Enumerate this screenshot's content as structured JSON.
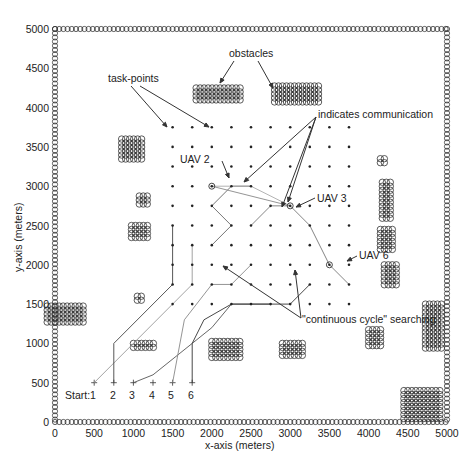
{
  "chart_data": {
    "type": "scatter",
    "title": "",
    "xlabel": "x-axis (meters)",
    "ylabel": "y-axis (meters)",
    "xlim": [
      0,
      5000
    ],
    "ylim": [
      0,
      5000
    ],
    "xticks": [
      0,
      500,
      1000,
      1500,
      2000,
      2500,
      3000,
      3500,
      4000,
      4500,
      5000
    ],
    "yticks": [
      0,
      500,
      1000,
      1500,
      2000,
      2500,
      3000,
      3500,
      4000,
      4500,
      5000
    ],
    "grid": false,
    "task_points": {
      "x": [
        1500,
        1750,
        2000,
        2250,
        2500,
        2750,
        3000,
        3250,
        3500,
        3750
      ],
      "y": [
        1500,
        1750,
        2000,
        2250,
        2500,
        2750,
        3000,
        3250,
        3500,
        3750
      ]
    },
    "start_positions": [
      {
        "label": "1",
        "x": 500,
        "y": 500
      },
      {
        "label": "2",
        "x": 750,
        "y": 500
      },
      {
        "label": "3",
        "x": 1000,
        "y": 500
      },
      {
        "label": "4",
        "x": 1250,
        "y": 500
      },
      {
        "label": "5",
        "x": 1500,
        "y": 500
      },
      {
        "label": "6",
        "x": 1750,
        "y": 500
      }
    ],
    "uav_positions": [
      {
        "name": "UAV 2",
        "x": 2000,
        "y": 3000
      },
      {
        "name": "UAV 3",
        "x": 3000,
        "y": 2750
      },
      {
        "name": "UAV 6",
        "x": 3500,
        "y": 2000
      }
    ],
    "obstacle_clusters": [
      {
        "x": 2100,
        "y": 4150,
        "w": 600,
        "h": 200
      },
      {
        "x": 3100,
        "y": 4150,
        "w": 600,
        "h": 250
      },
      {
        "x": 1000,
        "y": 3450,
        "w": 300,
        "h": 300
      },
      {
        "x": 1150,
        "y": 2800,
        "w": 150,
        "h": 150
      },
      {
        "x": 1100,
        "y": 2400,
        "w": 250,
        "h": 200
      },
      {
        "x": 1100,
        "y": 1550,
        "w": 100,
        "h": 100
      },
      {
        "x": 150,
        "y": 1350,
        "w": 500,
        "h": 250
      },
      {
        "x": 1150,
        "y": 950,
        "w": 300,
        "h": 100
      },
      {
        "x": 2200,
        "y": 900,
        "w": 400,
        "h": 250
      },
      {
        "x": 3050,
        "y": 900,
        "w": 300,
        "h": 200
      },
      {
        "x": 4100,
        "y": 1050,
        "w": 200,
        "h": 250
      },
      {
        "x": 4200,
        "y": 3300,
        "w": 100,
        "h": 100
      },
      {
        "x": 4250,
        "y": 2800,
        "w": 150,
        "h": 500
      },
      {
        "x": 4250,
        "y": 2300,
        "w": 200,
        "h": 300
      },
      {
        "x": 4300,
        "y": 1850,
        "w": 200,
        "h": 300
      },
      {
        "x": 4850,
        "y": 1200,
        "w": 250,
        "h": 600
      },
      {
        "x": 4700,
        "y": 200,
        "w": 500,
        "h": 400
      }
    ],
    "annotations": [
      "obstacles",
      "task-points",
      "indicates communication",
      "UAV 2",
      "UAV 3",
      "UAV 6",
      "\"continuous cycle\" searching",
      "Start:"
    ]
  },
  "labels": {
    "xlabel": "x-axis (meters)",
    "ylabel": "y-axis (meters)",
    "obstacles": "obstacles",
    "task_points": "task-points",
    "communication": "indicates communication",
    "uav2": "UAV 2",
    "uav3": "UAV 3",
    "uav6": "UAV 6",
    "cycle": "\"continuous cycle\" searching",
    "start": "Start:",
    "start_nums": [
      "1",
      "2",
      "3",
      "4",
      "5",
      "6"
    ]
  },
  "ticks": {
    "x": [
      "0",
      "500",
      "1000",
      "1500",
      "2000",
      "2500",
      "3000",
      "3500",
      "4000",
      "4500",
      "5000"
    ],
    "y": [
      "0",
      "500",
      "1000",
      "1500",
      "2000",
      "2500",
      "3000",
      "3500",
      "4000",
      "4500",
      "5000"
    ]
  }
}
